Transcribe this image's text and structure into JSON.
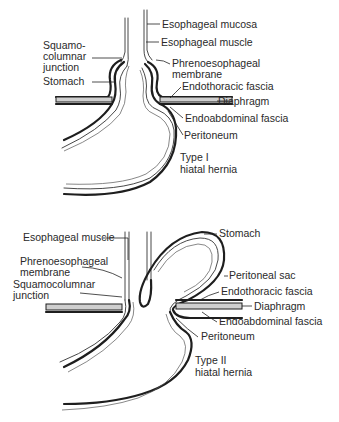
{
  "figure": {
    "panels": [
      {
        "id": "type-1",
        "title_line1": "Type I",
        "title_line2": "hiatal hernia",
        "labels": {
          "esophageal_mucosa": "Esophageal mucosa",
          "esophageal_muscle": "Esophageal muscle",
          "phrenoesophageal_line1": "Phrenoesophageal",
          "phrenoesophageal_line2": "membrane",
          "endothoracic_fascia": "Endothoracic fascia",
          "diaphragm": "Diaphragm",
          "endoabdominal_fascia": "Endoabdominal fascia",
          "peritoneum": "Peritoneum",
          "squamo_line1": "Squamo-",
          "squamo_line2": "columnar",
          "squamo_line3": "junction",
          "stomach": "Stomach"
        }
      },
      {
        "id": "type-2",
        "title_line1": "Type II",
        "title_line2": "hiatal hernia",
        "labels": {
          "esophageal_muscle": "Esophageal muscle",
          "phrenoesophageal_line1": "Phrenoesophageal",
          "phrenoesophageal_line2": "membrane",
          "squamocolumnar_line1": "Squamocolumnar",
          "squamocolumnar_line2": "junction",
          "stomach": "Stomach",
          "peritoneal_sac": "Peritoneal sac",
          "endothoracic_fascia": "Endothoracic fascia",
          "diaphragm": "Diaphragm",
          "endoabdominal_fascia": "Endoabdominal fascia",
          "peritoneum": "Peritoneum"
        }
      }
    ]
  }
}
